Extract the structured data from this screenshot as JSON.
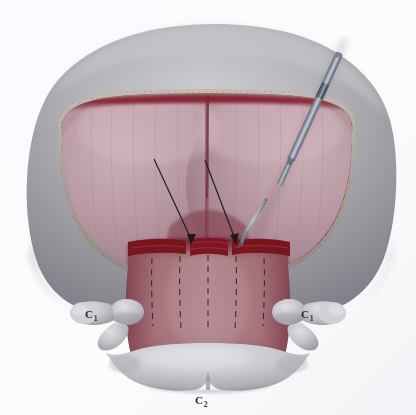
{
  "figure": {
    "background_color": "#fbfbfd"
  },
  "labels": [
    {
      "id": "label-c1-left",
      "letter": "C",
      "subscript": "1",
      "text": "C1",
      "x": 89,
      "y": 318,
      "side": "left"
    },
    {
      "id": "label-c1-right",
      "letter": "C",
      "subscript": "1",
      "text": "C1",
      "x": 305,
      "y": 318,
      "side": "right"
    },
    {
      "id": "label-c2",
      "letter": "C",
      "subscript": "2",
      "text": "C2",
      "x": 199,
      "y": 404,
      "side": "bottom"
    }
  ],
  "anatomy": {
    "skull_outer": {
      "name": "occipital-scalp-soft-tissue",
      "color": "#9a9a9e",
      "highlight": "#c2c2c6",
      "shadow": "#7d7d84"
    },
    "bone_edge": {
      "name": "craniectomy-bone-margin",
      "color": "#b0aaa2",
      "speckle_color": "#5e5951"
    },
    "dura_rim": {
      "name": "dural-margin",
      "color": "#8e2230"
    },
    "cerebellum": {
      "name": "cerebellar-hemispheres",
      "color": "#b2909c",
      "highlight": "#c9aeb6",
      "midline_color": "#7d3240"
    },
    "cervical_dura": {
      "name": "cervical-dura-muscle-column",
      "color": "#a9707a",
      "shadow": "#7e3b45"
    },
    "vertebra_c1": {
      "name": "c1-atlas-lateral-mass",
      "color": "#b9b9bd",
      "highlight": "#d6d6da"
    },
    "vertebra_c2": {
      "name": "c2-axis-spinous-process",
      "color": "#bdbdc1",
      "highlight": "#dcdce0"
    },
    "incision": {
      "name": "dural-incision",
      "color": "#7a1722"
    }
  },
  "instrument": {
    "name": "surgical-dissector",
    "shaft_color": "#8d96a4",
    "shaft_highlight": "#b9c1cc",
    "shaft_shadow": "#5d6672",
    "band_color": "#59616d",
    "blade_color": "#9aa2ae",
    "tip_color": "#5a626e",
    "angle_degrees": 54
  },
  "annotations": {
    "arrows": [
      {
        "id": "arrow-left",
        "name": "arrow-left-dural-incision",
        "from": [
          154,
          159
        ],
        "to": [
          193,
          242
        ],
        "color": "#1a1a1a"
      },
      {
        "id": "arrow-right",
        "name": "arrow-right-dural-incision",
        "from": [
          205,
          160
        ],
        "to": [
          237,
          242
        ],
        "color": "#1a1a1a"
      }
    ],
    "dashed_lines_count": 5,
    "dashed_line_color": "#2e2326"
  }
}
